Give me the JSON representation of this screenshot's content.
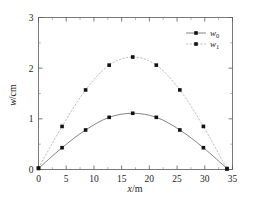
{
  "chart_data": {
    "type": "line",
    "title": "",
    "xlabel": "x/m",
    "ylabel": "w/cm",
    "xlim": [
      0,
      35
    ],
    "ylim": [
      0,
      3
    ],
    "xticks": [
      0,
      5,
      10,
      15,
      20,
      25,
      30,
      35
    ],
    "yticks": [
      0,
      1,
      2,
      3
    ],
    "xtick_labels": [
      "0",
      "5",
      "10",
      "15",
      "20",
      "25",
      "30",
      "35"
    ],
    "ytick_labels": [
      "0",
      "1",
      "2",
      "3"
    ],
    "grid": false,
    "minor_ticks": true,
    "frame": "box",
    "legend_position": "top-right",
    "x": [
      0,
      4.25,
      8.5,
      12.75,
      17,
      21.25,
      25.5,
      29.75,
      34
    ],
    "series": [
      {
        "name": "w0",
        "label_base": "w",
        "label_sub": "0",
        "line_style": "solid",
        "color": "#6e6e6e",
        "marker": "square",
        "marker_color": "#111111",
        "values": [
          0.02,
          0.43,
          0.78,
          1.03,
          1.11,
          1.03,
          0.78,
          0.43,
          0.02
        ]
      },
      {
        "name": "w1",
        "label_base": "w",
        "label_sub": "1",
        "line_style": "dashed",
        "color": "#b4b4b4",
        "marker": "square",
        "marker_color": "#111111",
        "values": [
          0.03,
          0.85,
          1.57,
          2.06,
          2.22,
          2.06,
          1.57,
          0.85,
          0.01
        ]
      }
    ]
  },
  "axes": {
    "x_label_text": "x",
    "x_label_unit": "/m",
    "y_label_text": "w",
    "y_label_unit": "/cm"
  },
  "legend": {
    "entries": [
      {
        "base": "w",
        "sub": "0"
      },
      {
        "base": "w",
        "sub": "1"
      }
    ]
  },
  "colors": {
    "background": "#ffffff",
    "frame": "#5a5a5a",
    "series_w0": "#6e6e6e",
    "series_w1": "#b4b4b4",
    "marker": "#111111",
    "text": "#1c1c1c"
  }
}
